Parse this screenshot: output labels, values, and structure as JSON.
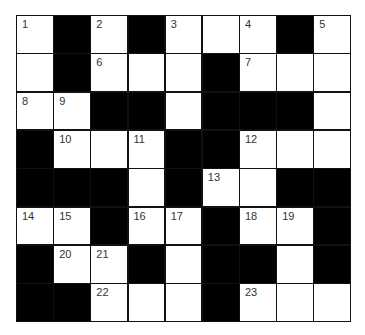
{
  "puzzle": {
    "rows": 8,
    "cols": 9,
    "colors": {
      "block": "#000000",
      "open": "#ffffff",
      "border": "#111111",
      "number": "#333333"
    },
    "grid": [
      [
        "1",
        "#",
        "2",
        "#",
        "3",
        "",
        "4",
        "#",
        "5"
      ],
      [
        "",
        "#",
        "6",
        "",
        "",
        "#",
        "7",
        "",
        ""
      ],
      [
        "8",
        "9",
        "#",
        "#",
        "",
        "#",
        "#",
        "#",
        ""
      ],
      [
        "#",
        "10",
        "",
        "11",
        "#",
        "#",
        "12",
        "",
        ""
      ],
      [
        "#",
        "#",
        "#",
        "",
        "#",
        "13",
        "",
        "#",
        "#"
      ],
      [
        "14",
        "15",
        "#",
        "16",
        "17",
        "#",
        "18",
        "19",
        "#"
      ],
      [
        "#",
        "20",
        "21",
        "#",
        "",
        "#",
        "#",
        "",
        "#"
      ],
      [
        "#",
        "#",
        "22",
        "",
        "",
        "#",
        "23",
        "",
        ""
      ]
    ]
  }
}
